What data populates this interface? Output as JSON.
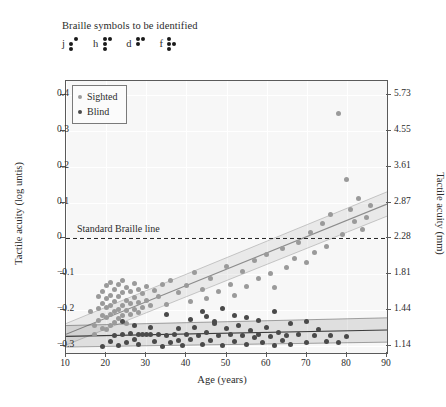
{
  "header": {
    "braille_title": "Braille symbols to be identified",
    "symbols": [
      {
        "letter": "j",
        "dots": [
          0,
          1,
          1,
          1,
          0,
          0
        ]
      },
      {
        "letter": "h",
        "dots": [
          1,
          1,
          1,
          1,
          0,
          0
        ]
      },
      {
        "letter": "d",
        "dots": [
          1,
          1,
          0,
          1,
          0,
          0
        ]
      },
      {
        "letter": "f",
        "dots": [
          1,
          1,
          1,
          0,
          1,
          0
        ]
      }
    ]
  },
  "chart_data": {
    "type": "scatter",
    "title": "",
    "xlabel": "Age (years)",
    "ylabel": "Tactile acuity (log untis)",
    "ylabel_right": "Tactile acuity (mm)",
    "xlim": [
      10,
      90
    ],
    "ylim": [
      -0.32,
      0.44
    ],
    "xticks": [
      10,
      20,
      30,
      40,
      50,
      60,
      70,
      80,
      90
    ],
    "yticks_left": [
      0.4,
      0.3,
      0.2,
      0.1,
      0,
      -0.1,
      -0.2,
      -0.3
    ],
    "yticks_right": [
      "5.73",
      "4.55",
      "3.61",
      "2.87",
      "2.28",
      "1.81",
      "1.44",
      "1.14"
    ],
    "yticks_right_values": [
      0.4,
      0.3,
      0.2,
      0.1,
      0,
      -0.1,
      -0.2,
      -0.3
    ],
    "grid": true,
    "legend_position": "top-left",
    "annotations": [
      {
        "text": "Standard Braille line",
        "x": 13,
        "y": 0.022,
        "style": "dashed-hline",
        "y_line": 0
      }
    ],
    "series": [
      {
        "name": "Sighted",
        "color": "#9a9a9a",
        "marker": "circle",
        "fit": {
          "type": "linear",
          "intercept": -0.3132,
          "slope": 0.00455,
          "ci_band": true,
          "color": "#8c8c8c"
        },
        "points": [
          [
            16,
            -0.205
          ],
          [
            17,
            -0.242
          ],
          [
            17,
            -0.268
          ],
          [
            18,
            -0.162
          ],
          [
            18,
            -0.196
          ],
          [
            18,
            -0.228
          ],
          [
            19,
            -0.147
          ],
          [
            19,
            -0.183
          ],
          [
            19,
            -0.215
          ],
          [
            19,
            -0.251
          ],
          [
            20,
            -0.131
          ],
          [
            20,
            -0.168
          ],
          [
            20,
            -0.192
          ],
          [
            20,
            -0.221
          ],
          [
            20,
            -0.255
          ],
          [
            21,
            -0.122
          ],
          [
            21,
            -0.158
          ],
          [
            21,
            -0.188
          ],
          [
            21,
            -0.213
          ],
          [
            21,
            -0.243
          ],
          [
            22,
            -0.142
          ],
          [
            22,
            -0.176
          ],
          [
            22,
            -0.205
          ],
          [
            22,
            -0.235
          ],
          [
            23,
            -0.128
          ],
          [
            23,
            -0.162
          ],
          [
            23,
            -0.198
          ],
          [
            23,
            -0.224
          ],
          [
            24,
            -0.118
          ],
          [
            24,
            -0.152
          ],
          [
            24,
            -0.186
          ],
          [
            24,
            -0.216
          ],
          [
            25,
            -0.136
          ],
          [
            25,
            -0.172
          ],
          [
            25,
            -0.202
          ],
          [
            25,
            -0.238
          ],
          [
            26,
            -0.148
          ],
          [
            26,
            -0.182
          ],
          [
            26,
            -0.212
          ],
          [
            27,
            -0.125
          ],
          [
            27,
            -0.165
          ],
          [
            27,
            -0.198
          ],
          [
            28,
            -0.142
          ],
          [
            28,
            -0.178
          ],
          [
            28,
            -0.208
          ],
          [
            29,
            -0.155
          ],
          [
            29,
            -0.192
          ],
          [
            30,
            -0.135
          ],
          [
            30,
            -0.172
          ],
          [
            31,
            -0.188
          ],
          [
            32,
            -0.145
          ],
          [
            33,
            -0.162
          ],
          [
            34,
            -0.128
          ],
          [
            35,
            -0.185
          ],
          [
            36,
            -0.118
          ],
          [
            38,
            -0.152
          ],
          [
            40,
            -0.132
          ],
          [
            41,
            -0.175
          ],
          [
            42,
            -0.095
          ],
          [
            44,
            -0.142
          ],
          [
            45,
            -0.168
          ],
          [
            46,
            -0.112
          ],
          [
            48,
            -0.148
          ],
          [
            50,
            -0.078
          ],
          [
            51,
            -0.128
          ],
          [
            52,
            -0.158
          ],
          [
            54,
            -0.092
          ],
          [
            55,
            -0.135
          ],
          [
            57,
            -0.062
          ],
          [
            58,
            -0.112
          ],
          [
            60,
            -0.045
          ],
          [
            61,
            -0.098
          ],
          [
            62,
            -0.138
          ],
          [
            64,
            -0.028
          ],
          [
            65,
            -0.082
          ],
          [
            67,
            -0.055
          ],
          [
            68,
            -0.012
          ],
          [
            70,
            -0.068
          ],
          [
            71,
            0.018
          ],
          [
            72,
            -0.038
          ],
          [
            74,
            0.042
          ],
          [
            75,
            -0.022
          ],
          [
            76,
            0.068
          ],
          [
            78,
            0.348
          ],
          [
            79,
            0.012
          ],
          [
            80,
            0.165
          ],
          [
            81,
            0.082
          ],
          [
            82,
            0.048
          ],
          [
            83,
            0.112
          ],
          [
            84,
            0.025
          ],
          [
            85,
            0.058
          ],
          [
            86,
            0.092
          ]
        ]
      },
      {
        "name": "Blind",
        "color": "#4a4a4a",
        "marker": "circle",
        "fit": {
          "type": "linear",
          "intercept": -0.2755,
          "slope": 0.00022,
          "ci_band": true,
          "color": "#3c3c3c"
        },
        "points": [
          [
            19,
            -0.302
          ],
          [
            21,
            -0.288
          ],
          [
            22,
            -0.272
          ],
          [
            23,
            -0.298
          ],
          [
            24,
            -0.268
          ],
          [
            25,
            -0.292
          ],
          [
            26,
            -0.265
          ],
          [
            27,
            -0.282
          ],
          [
            28,
            -0.268
          ],
          [
            28,
            -0.295
          ],
          [
            29,
            -0.268
          ],
          [
            30,
            -0.268
          ],
          [
            31,
            -0.268
          ],
          [
            32,
            -0.288
          ],
          [
            33,
            -0.268
          ],
          [
            34,
            -0.302
          ],
          [
            35,
            -0.272
          ],
          [
            36,
            -0.292
          ],
          [
            37,
            -0.268
          ],
          [
            38,
            -0.285
          ],
          [
            38,
            -0.252
          ],
          [
            39,
            -0.298
          ],
          [
            40,
            -0.268
          ],
          [
            41,
            -0.282
          ],
          [
            42,
            -0.248
          ],
          [
            43,
            -0.272
          ],
          [
            44,
            -0.295
          ],
          [
            45,
            -0.262
          ],
          [
            46,
            -0.285
          ],
          [
            47,
            -0.238
          ],
          [
            48,
            -0.272
          ],
          [
            49,
            -0.298
          ],
          [
            50,
            -0.252
          ],
          [
            51,
            -0.268
          ],
          [
            52,
            -0.288
          ],
          [
            53,
            -0.242
          ],
          [
            54,
            -0.272
          ],
          [
            55,
            -0.295
          ],
          [
            56,
            -0.258
          ],
          [
            57,
            -0.278
          ],
          [
            58,
            -0.268
          ],
          [
            59,
            -0.292
          ],
          [
            60,
            -0.248
          ],
          [
            61,
            -0.275
          ],
          [
            62,
            -0.298
          ],
          [
            63,
            -0.262
          ],
          [
            64,
            -0.285
          ],
          [
            65,
            -0.272
          ],
          [
            66,
            -0.295
          ],
          [
            68,
            -0.268
          ],
          [
            70,
            -0.292
          ],
          [
            72,
            -0.272
          ],
          [
            73,
            -0.255
          ],
          [
            75,
            -0.288
          ],
          [
            76,
            -0.272
          ],
          [
            78,
            -0.292
          ],
          [
            80,
            -0.275
          ],
          [
            35,
            -0.212
          ],
          [
            45,
            -0.218
          ],
          [
            47,
            -0.232
          ],
          [
            52,
            -0.215
          ],
          [
            58,
            -0.228
          ],
          [
            62,
            -0.205
          ],
          [
            49,
            -0.195
          ],
          [
            44,
            -0.205
          ],
          [
            55,
            -0.222
          ],
          [
            66,
            -0.238
          ],
          [
            70,
            -0.232
          ],
          [
            41,
            -0.225
          ],
          [
            31,
            -0.248
          ],
          [
            27,
            -0.242
          ],
          [
            24,
            -0.232
          ]
        ]
      }
    ]
  },
  "legend": {
    "items": [
      {
        "label": "Sighted",
        "color": "#9a9a9a"
      },
      {
        "label": "Blind",
        "color": "#4a4a4a"
      }
    ]
  }
}
